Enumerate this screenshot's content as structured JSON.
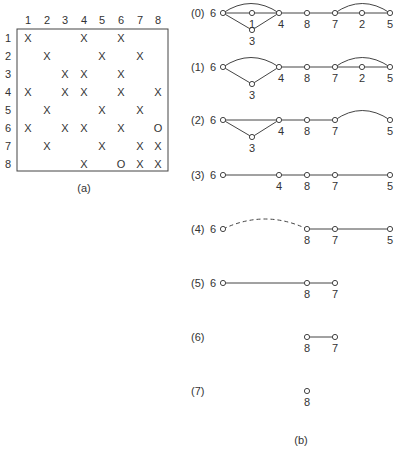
{
  "part_a": {
    "caption": "(a)",
    "col_headers": [
      "1",
      "2",
      "3",
      "4",
      "5",
      "6",
      "7",
      "8"
    ],
    "row_headers": [
      "1",
      "2",
      "3",
      "4",
      "5",
      "6",
      "7",
      "8"
    ],
    "cells": [
      [
        "X",
        "",
        "",
        "X",
        "",
        "X",
        "",
        ""
      ],
      [
        "",
        "X",
        "",
        "",
        "X",
        "",
        "X",
        ""
      ],
      [
        "",
        "",
        "X",
        "X",
        "",
        "X",
        "",
        ""
      ],
      [
        "X",
        "",
        "X",
        "X",
        "",
        "X",
        "",
        "X"
      ],
      [
        "",
        "X",
        "",
        "",
        "X",
        "",
        "X",
        ""
      ],
      [
        "X",
        "",
        "X",
        "X",
        "",
        "X",
        "",
        "O"
      ],
      [
        "",
        "X",
        "",
        "",
        "X",
        "",
        "X",
        "X"
      ],
      [
        "",
        "",
        "",
        "X",
        "",
        "O",
        "X",
        "X"
      ]
    ]
  },
  "part_b": {
    "caption": "(b)",
    "steps": [
      {
        "label": "(0)",
        "nodes": [
          "6",
          "1",
          "3",
          "4",
          "8",
          "7",
          "2",
          "5"
        ]
      },
      {
        "label": "(1)",
        "nodes": [
          "6",
          "3",
          "4",
          "8",
          "7",
          "2",
          "5"
        ]
      },
      {
        "label": "(2)",
        "nodes": [
          "6",
          "3",
          "4",
          "8",
          "7",
          "5"
        ]
      },
      {
        "label": "(3)",
        "nodes": [
          "6",
          "4",
          "8",
          "7",
          "5"
        ]
      },
      {
        "label": "(4)",
        "nodes": [
          "6",
          "8",
          "7",
          "5"
        ]
      },
      {
        "label": "(5)",
        "nodes": [
          "6",
          "8",
          "7"
        ]
      },
      {
        "label": "(6)",
        "nodes": [
          "8",
          "7"
        ]
      },
      {
        "label": "(7)",
        "nodes": [
          "8"
        ]
      }
    ]
  }
}
